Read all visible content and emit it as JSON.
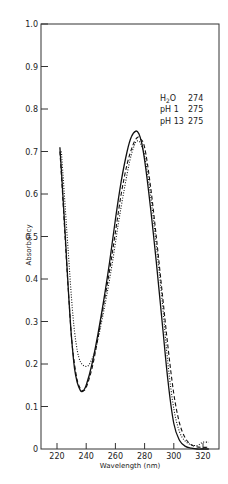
{
  "chart_data": {
    "type": "line",
    "title": "",
    "xlabel": "Wavelength (nm)",
    "ylabel": "Absorbancy",
    "xlim": [
      212,
      326
    ],
    "ylim": [
      0,
      1.0
    ],
    "x_ticks": [
      220,
      240,
      260,
      280,
      300,
      320
    ],
    "y_ticks": [
      0,
      0.1,
      0.2,
      0.3,
      0.4,
      0.5,
      0.6,
      0.7,
      0.8,
      0.9,
      1.0
    ],
    "y_tick_labels": [
      "0",
      "0.1",
      "0.2",
      "0.3",
      "0.4",
      "0.5",
      "0.6",
      "0.7",
      "0.8",
      "0.9",
      "1.0"
    ],
    "grid": false,
    "legend_position": "upper right (inside)",
    "legend": [
      {
        "label": "H2O",
        "lambda_max": "274",
        "style": "solid"
      },
      {
        "label": "pH 1",
        "lambda_max": "275",
        "style": "dotted"
      },
      {
        "label": "pH 13",
        "lambda_max": "275",
        "style": "dashed"
      }
    ],
    "series": [
      {
        "name": "H2O",
        "style": "solid",
        "x": [
          222,
          224,
          226,
          228,
          230,
          232,
          234,
          236,
          237,
          238,
          240,
          244,
          248,
          252,
          256,
          260,
          264,
          268,
          271,
          274,
          276,
          278,
          280,
          284,
          288,
          292,
          296,
          300,
          304,
          308,
          312,
          316,
          320,
          324
        ],
        "y": [
          0.71,
          0.6,
          0.48,
          0.36,
          0.26,
          0.19,
          0.155,
          0.138,
          0.135,
          0.137,
          0.15,
          0.2,
          0.27,
          0.35,
          0.44,
          0.54,
          0.63,
          0.7,
          0.735,
          0.748,
          0.742,
          0.72,
          0.68,
          0.57,
          0.44,
          0.3,
          0.16,
          0.06,
          0.02,
          0.006,
          0.002,
          0.0,
          0.0,
          0.0
        ]
      },
      {
        "name": "pH 1",
        "style": "dotted",
        "x": [
          223,
          225,
          227,
          229,
          231,
          233,
          235,
          237,
          239,
          241,
          243,
          246,
          250,
          254,
          258,
          262,
          266,
          270,
          273,
          275,
          277,
          280,
          284,
          288,
          292,
          296,
          300,
          304,
          308,
          312,
          316,
          318,
          320,
          324
        ],
        "y": [
          0.7,
          0.6,
          0.5,
          0.4,
          0.31,
          0.25,
          0.215,
          0.2,
          0.195,
          0.195,
          0.205,
          0.23,
          0.29,
          0.36,
          0.44,
          0.53,
          0.61,
          0.68,
          0.715,
          0.725,
          0.72,
          0.69,
          0.6,
          0.48,
          0.35,
          0.2,
          0.095,
          0.04,
          0.018,
          0.01,
          0.008,
          0.012,
          0.016,
          0.016
        ]
      },
      {
        "name": "pH 13",
        "style": "dashed",
        "x": [
          222,
          224,
          226,
          228,
          230,
          232,
          234,
          236,
          238,
          240,
          244,
          248,
          252,
          256,
          260,
          264,
          268,
          272,
          275,
          277,
          280,
          284,
          288,
          292,
          296,
          300,
          304,
          308,
          312,
          316,
          320,
          324
        ],
        "y": [
          0.7,
          0.59,
          0.47,
          0.36,
          0.26,
          0.2,
          0.16,
          0.142,
          0.137,
          0.145,
          0.19,
          0.26,
          0.34,
          0.42,
          0.51,
          0.6,
          0.67,
          0.715,
          0.733,
          0.73,
          0.71,
          0.62,
          0.5,
          0.37,
          0.24,
          0.13,
          0.06,
          0.025,
          0.01,
          0.005,
          0.004,
          0.004
        ]
      }
    ]
  },
  "legend_rows": [
    {
      "label": "H2O",
      "value": "274"
    },
    {
      "label": "pH 1",
      "value": "275"
    },
    {
      "label": "pH 13",
      "value": "275"
    }
  ]
}
